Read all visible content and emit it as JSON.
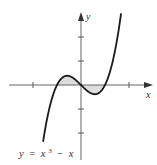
{
  "chart_data": {
    "type": "line",
    "title": "",
    "xlabel": "x",
    "ylabel": "y",
    "equation_label": "y = x³ − x",
    "function": "x^3 - x",
    "xlim": [
      -3.0,
      3.0
    ],
    "ylim": [
      -3.2,
      3.1
    ],
    "x_ticks": [
      -2,
      2
    ],
    "y_ticks": [
      -2,
      -1,
      1,
      2
    ],
    "tick_labels_shown": false,
    "grid": false,
    "legend": null,
    "zeros": [
      -1,
      0,
      1
    ],
    "shaded_regions": [
      {
        "from": -1,
        "to": 0,
        "description": "region between curve and x-axis (above axis)"
      },
      {
        "from": 0,
        "to": 1,
        "description": "region between curve and x-axis (below axis)"
      }
    ],
    "sample_points": [
      {
        "x": -1.75,
        "y": -3.61
      },
      {
        "x": -1.5,
        "y": -1.88
      },
      {
        "x": -1.0,
        "y": 0.0
      },
      {
        "x": -0.577,
        "y": 0.385
      },
      {
        "x": 0.0,
        "y": 0.0
      },
      {
        "x": 0.577,
        "y": -0.385
      },
      {
        "x": 1.0,
        "y": 0.0
      },
      {
        "x": 1.5,
        "y": 1.88
      },
      {
        "x": 1.7,
        "y": 3.21
      }
    ],
    "colors": {
      "curve": "#1a1a1a",
      "axes": "#555555",
      "shade": "#dddddd"
    }
  },
  "labels": {
    "x_axis": "x",
    "y_axis": "y",
    "equation_lhs": "y",
    "equation_eq": "=",
    "equation_x": "x",
    "equation_exp": "3",
    "equation_minus": "−",
    "equation_x2": "x"
  }
}
